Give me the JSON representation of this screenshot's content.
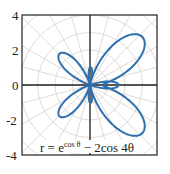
{
  "chart_data": {
    "type": "line",
    "subtype": "polar",
    "title": "",
    "equation": "r = e^{cos θ} − 2 cos 4θ",
    "label": {
      "base": "r = e",
      "sup": "cos θ",
      "rest": " − 2cos 4θ"
    },
    "xlabel": "",
    "ylabel": "",
    "ylim": [
      -4,
      4
    ],
    "yticks": [
      "4",
      "2",
      "0",
      "-2",
      "-4"
    ],
    "grid": "polar (circles + radial lines every 15°)",
    "series": [
      {
        "name": "r = e^cosθ − 2cos4θ",
        "color": "#2e6fb0"
      }
    ]
  },
  "colors": {
    "curve": "#2e6fb0",
    "grid": "#d8d2cc",
    "axis": "#222222"
  }
}
